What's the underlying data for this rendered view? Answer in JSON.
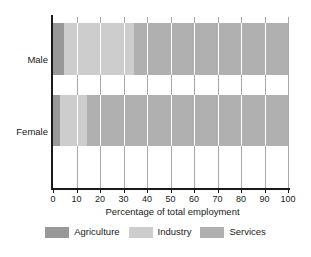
{
  "chart_data": {
    "type": "bar",
    "orientation": "horizontal",
    "stacked": true,
    "title": "",
    "xlabel": "Percentage of total employment",
    "ylabel": "",
    "categories": [
      "Male",
      "Female"
    ],
    "xlim": [
      0,
      100
    ],
    "xticks": [
      0,
      10,
      20,
      30,
      40,
      50,
      60,
      70,
      80,
      90,
      100
    ],
    "xtick_labels": [
      "0",
      "10",
      "20",
      "30",
      "40",
      "50",
      "60",
      "70",
      "80",
      "90",
      "100"
    ],
    "grid": "vertical",
    "legend_position": "bottom",
    "series": [
      {
        "name": "Agriculture",
        "color": "#989898",
        "values": [
          4.5,
          3.0
        ]
      },
      {
        "name": "Industry",
        "color": "#cdcdcd",
        "values": [
          30.0,
          11.5
        ]
      },
      {
        "name": "Services",
        "color": "#b0b0b0",
        "values": [
          65.5,
          85.5
        ]
      }
    ]
  },
  "colors": {
    "agriculture": "#989898",
    "industry": "#cdcdcd",
    "services": "#b0b0b0",
    "axis": "#1a1a1a",
    "gridline": "#a8a8a8",
    "background": "#ffffff"
  }
}
